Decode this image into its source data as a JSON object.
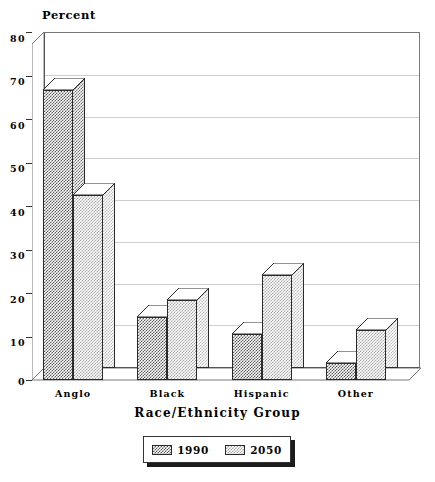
{
  "chart_data": {
    "type": "bar",
    "title": "",
    "ylabel": "Percent",
    "xlabel": "Race/Ethnicity Group",
    "categories": [
      "Anglo",
      "Black",
      "Hispanic",
      "Other"
    ],
    "series": [
      {
        "name": "1990",
        "values": [
          69,
          15,
          11,
          4
        ],
        "color": "#595959"
      },
      {
        "name": "2050",
        "values": [
          44,
          19,
          25,
          12
        ],
        "color": "#a8a8a8"
      }
    ],
    "ylim": [
      0,
      80
    ],
    "yticks": [
      0,
      10,
      20,
      30,
      40,
      50,
      60,
      70,
      80
    ],
    "ytick_labels": [
      "0",
      "10",
      "20",
      "30",
      "40",
      "50",
      "60",
      "70",
      "80"
    ],
    "grid": true,
    "legend_position": "bottom",
    "style": "3d-bar"
  },
  "legend": {
    "entries": [
      {
        "label": "1990",
        "swatch": "pattern-dark-checker"
      },
      {
        "label": "2050",
        "swatch": "pattern-light-checker"
      }
    ]
  }
}
